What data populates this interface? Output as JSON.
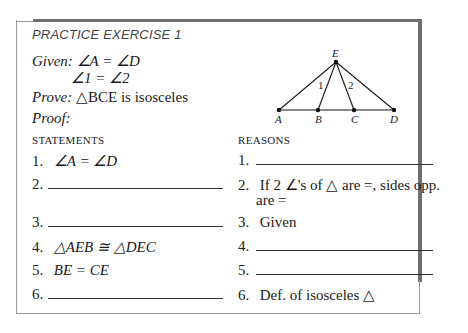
{
  "exercise": {
    "title": "PRACTICE EXERCISE 1",
    "given_label": "Given:",
    "given_line1": "∠A = ∠D",
    "given_line2": "∠1 = ∠2",
    "prove_label": "Prove:",
    "prove_statement": "△BCE is isosceles",
    "proof_label": "Proof:"
  },
  "figure": {
    "points": {
      "E": {
        "label": "E",
        "x": 336,
        "y": 62
      },
      "A": {
        "label": "A",
        "x": 279,
        "y": 110
      },
      "B": {
        "label": "B",
        "x": 318,
        "y": 110
      },
      "C": {
        "label": "C",
        "x": 354,
        "y": 110
      },
      "D": {
        "label": "D",
        "x": 394,
        "y": 110
      }
    },
    "angle_labels": [
      "1",
      "2"
    ]
  },
  "table": {
    "statements_header": "STATEMENTS",
    "reasons_header": "REASONS",
    "rows": [
      {
        "num": "1.",
        "statement": "∠A = ∠D",
        "reason": ""
      },
      {
        "num": "2.",
        "statement": "",
        "reason": "If 2 ∠'s of △ are =, sides opp.",
        "reason_cont": "are ="
      },
      {
        "num": "3.",
        "statement": "",
        "reason": "Given"
      },
      {
        "num": "4.",
        "statement": "△AEB ≅ △DEC",
        "reason": ""
      },
      {
        "num": "5.",
        "statement": "BE = CE",
        "reason": ""
      },
      {
        "num": "6.",
        "statement": "",
        "reason": "Def. of isosceles △"
      }
    ]
  }
}
